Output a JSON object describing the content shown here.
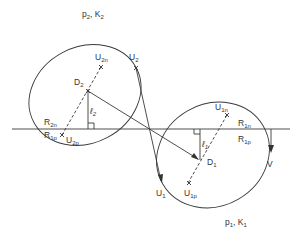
{
  "diagram": {
    "labels": {
      "p2k2": {
        "main": "p",
        "sub": "2",
        "sep": ", K",
        "sub2": "2"
      },
      "p1k1": {
        "main": "p",
        "sub": "1",
        "sep": ", K",
        "sub2": "1"
      },
      "U2n": {
        "main": "U",
        "sub": "2n"
      },
      "U2": {
        "main": "U",
        "sub": "2"
      },
      "D2": {
        "main": "D",
        "sub": "2"
      },
      "l2": {
        "main": "ℓ",
        "sub": "2"
      },
      "R2n": {
        "main": "R",
        "sub": "2n"
      },
      "R1p_left": {
        "main": "R",
        "sub": "1p"
      },
      "U2p": {
        "main": "U",
        "sub": "2p"
      },
      "U1n": {
        "main": "U",
        "sub": "1n"
      },
      "R1n": {
        "main": "R",
        "sub": "1n"
      },
      "R1p_right": {
        "main": "R",
        "sub": "1p"
      },
      "l1": {
        "main": "ℓ",
        "sub": "1"
      },
      "D1": {
        "main": "D",
        "sub": "1"
      },
      "U1": {
        "main": "U",
        "sub": "1"
      },
      "U1p": {
        "main": "U",
        "sub": "1p"
      },
      "V": {
        "main": "V"
      }
    }
  }
}
